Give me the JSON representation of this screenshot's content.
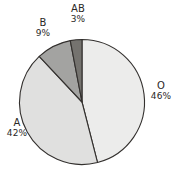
{
  "chart_data": {
    "type": "pie",
    "title": "",
    "subtitle": "",
    "xlabel": "",
    "ylabel": "",
    "legend_position": "none",
    "grid": false,
    "labels_outside": true,
    "categories": [
      "O",
      "A",
      "B",
      "AB"
    ],
    "values": [
      46,
      42,
      9,
      3
    ],
    "unit": "%",
    "slices": [
      {
        "label": "O",
        "value": 46,
        "value_text": "46%",
        "color": "#ececeb",
        "start_angle_deg": 0,
        "end_angle_deg": 165.6
      },
      {
        "label": "A",
        "value": 42,
        "value_text": "42%",
        "color": "#e0e0df",
        "start_angle_deg": 165.6,
        "end_angle_deg": 316.8
      },
      {
        "label": "B",
        "value": 9,
        "value_text": "9%",
        "color": "#a3a3a1",
        "start_angle_deg": 316.8,
        "end_angle_deg": 349.2
      },
      {
        "label": "AB",
        "value": 3,
        "value_text": "3%",
        "color": "#75736f",
        "start_angle_deg": 349.2,
        "end_angle_deg": 360
      }
    ],
    "outline_color": "#33302e",
    "background_color": "#ffffff",
    "text_color": "#2b2826"
  },
  "labels": {
    "o": {
      "name": "O",
      "value": "46%"
    },
    "a": {
      "name": "A",
      "value": "42%"
    },
    "b": {
      "name": "B",
      "value": "9%"
    },
    "ab": {
      "name": "AB",
      "value": "3%"
    }
  }
}
